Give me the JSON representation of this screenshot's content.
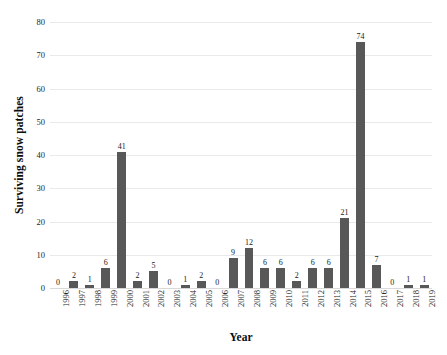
{
  "chart_data": {
    "type": "bar",
    "title": "",
    "subtitle": "",
    "xlabel": "Year",
    "ylabel": "Surviving snow patches",
    "categories": [
      "1996",
      "1997",
      "1998",
      "1999",
      "2000",
      "2001",
      "2002",
      "2003",
      "2004",
      "2005",
      "2006",
      "2007",
      "2008",
      "2009",
      "2010",
      "2011",
      "2012",
      "2013",
      "2014",
      "2015",
      "2016",
      "2017",
      "2018",
      "2019"
    ],
    "values": [
      0,
      2,
      1,
      6,
      41,
      2,
      5,
      0,
      1,
      2,
      0,
      9,
      12,
      6,
      6,
      2,
      6,
      6,
      21,
      74,
      7,
      0,
      1,
      1
    ],
    "data_labels": [
      "0",
      "2",
      "1",
      "6",
      "41",
      "2",
      "5",
      "0",
      "1",
      "2",
      "0",
      "9",
      "12",
      "6",
      "6",
      "2",
      "6",
      "6",
      "21",
      "74",
      "7",
      "0",
      "1",
      "1"
    ],
    "ylim": [
      0,
      80
    ],
    "ytick_labels": [
      "80",
      "70",
      "60",
      "50",
      "40",
      "30",
      "20",
      "10",
      "0"
    ],
    "ytick_values": [
      80,
      70,
      60,
      50,
      40,
      30,
      20,
      10,
      0
    ],
    "grid": true,
    "grid_axis": "y",
    "legend": false,
    "legend_position": "none",
    "bar_color": "#585858",
    "grid_color": "#e9e9e9",
    "text_color": "#1a1a1a",
    "background_color": "#ffffff"
  }
}
